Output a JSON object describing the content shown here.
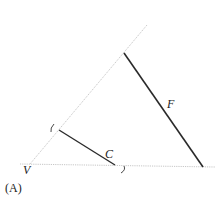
{
  "figure": {
    "panel_label": "(A)",
    "vertex_label": "V",
    "segments": [
      {
        "name": "C",
        "label": "C"
      },
      {
        "name": "F",
        "label": "F"
      }
    ],
    "colors": {
      "segment": "#2a2a2a",
      "guide": "#b8b8b8",
      "text": "#222222",
      "background": "#ffffff"
    }
  }
}
